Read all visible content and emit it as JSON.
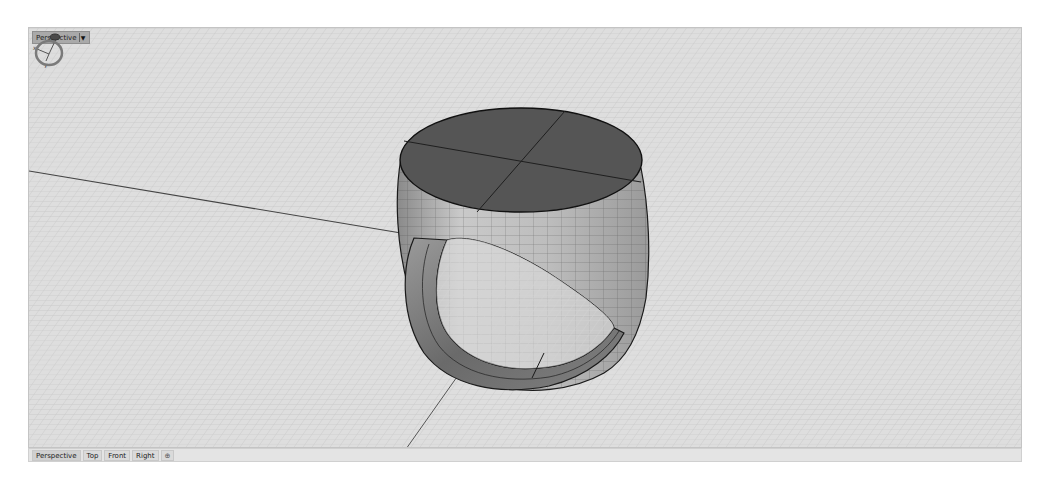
{
  "viewport": {
    "title": "Perspective",
    "title_dropdown_icon": "chevron-down-icon",
    "display_mode": "shaded",
    "background_color": "#dcdcdc",
    "grid_color": "#c4c4c4",
    "object": "signet-ring",
    "axis_widget": {
      "x_label": "x",
      "y_label": "y",
      "z_label": "z"
    },
    "nav_widget_icon": "ring-orbit-icon"
  },
  "tabs": [
    {
      "label": "Perspective",
      "active": true
    },
    {
      "label": "Top",
      "active": false
    },
    {
      "label": "Front",
      "active": false
    },
    {
      "label": "Right",
      "active": false
    },
    {
      "label": "⊕",
      "active": false,
      "kind": "add-viewport"
    }
  ],
  "colors": {
    "ring_top": "#545454",
    "ring_side": "#b8b8b8",
    "ring_shank": "#6e6e6e",
    "edge": "#1a1a1a",
    "axis_line": "#444444"
  }
}
